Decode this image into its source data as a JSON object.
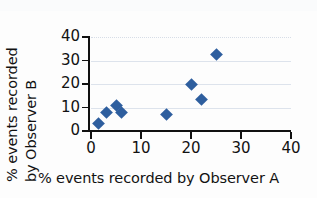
{
  "chart_data": {
    "type": "scatter",
    "title": "",
    "xlabel": "% events recorded by Observer A",
    "ylabel_line1": "% events recorded",
    "ylabel_line2": "by Observer B",
    "xlim": [
      0,
      40
    ],
    "ylim": [
      0,
      40
    ],
    "xticks": [
      0,
      10,
      20,
      30,
      40
    ],
    "yticks": [
      0,
      10,
      20,
      30,
      40
    ],
    "xtick_labels": [
      "0",
      "10",
      "20",
      "30",
      "40"
    ],
    "ytick_labels": [
      "0",
      "10",
      "20",
      "30",
      "40"
    ],
    "grid": "horizontal",
    "legend": "none",
    "marker": "diamond",
    "marker_color": "#2e5e9e",
    "gridline_color": "#dde3ec",
    "axis_color": "#111111",
    "points": [
      {
        "x": 1.5,
        "y": 3
      },
      {
        "x": 3,
        "y": 8
      },
      {
        "x": 5,
        "y": 11
      },
      {
        "x": 6,
        "y": 8
      },
      {
        "x": 15,
        "y": 7
      },
      {
        "x": 20,
        "y": 20
      },
      {
        "x": 22,
        "y": 13.5
      },
      {
        "x": 25,
        "y": 32.5
      }
    ]
  }
}
